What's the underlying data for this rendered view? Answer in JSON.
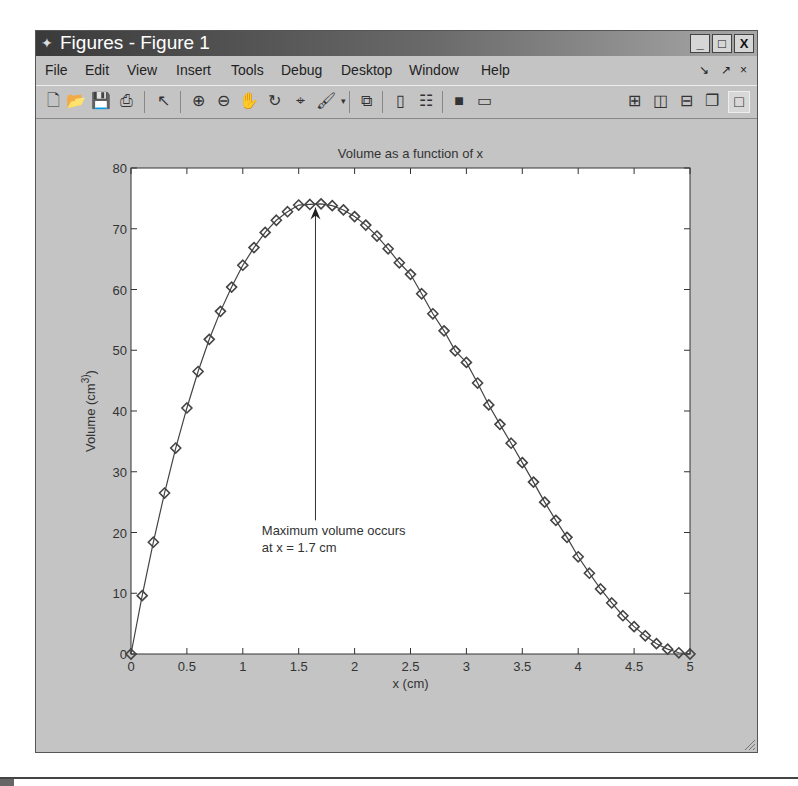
{
  "window": {
    "title": "Figures - Figure 1",
    "controls": {
      "minimize": "_",
      "maximize": "□",
      "close": "X"
    }
  },
  "menubar": {
    "items": [
      "File",
      "Edit",
      "View",
      "Insert",
      "Tools",
      "Debug",
      "Desktop",
      "Window",
      "Help"
    ],
    "dock_controls": {
      "dock": "↘",
      "undock": "↗",
      "close": "×"
    }
  },
  "toolbar": {
    "buttons": [
      "new-figure",
      "open-file",
      "save-figure",
      "print-figure",
      "edit-plot",
      "zoom-in",
      "zoom-out",
      "pan",
      "rotate-3d",
      "data-cursor",
      "brush",
      "link-plot",
      "hide-plot-tools",
      "show-plot-tools",
      "colorbar",
      "legend",
      "tile-2x2",
      "tile-columns",
      "tile-rows",
      "float",
      "maximize"
    ]
  },
  "chart_data": {
    "type": "line",
    "title": "Volume as a function of x",
    "xlabel": "x (cm)",
    "ylabel": "Volume (cm^3)",
    "xlim": [
      0,
      5
    ],
    "ylim": [
      0,
      80
    ],
    "xticks": [
      "0",
      "0.5",
      "1",
      "1.5",
      "2",
      "2.5",
      "3",
      "3.5",
      "4",
      "4.5",
      "5"
    ],
    "yticks": [
      "0",
      "10",
      "20",
      "30",
      "40",
      "50",
      "60",
      "70",
      "80"
    ],
    "grid": false,
    "legend": null,
    "marker": "diamond",
    "series": [
      {
        "name": "V(x)",
        "x": [
          0,
          0.1,
          0.2,
          0.3,
          0.4,
          0.5,
          0.6,
          0.7,
          0.8,
          0.9,
          1.0,
          1.1,
          1.2,
          1.3,
          1.4,
          1.5,
          1.6,
          1.7,
          1.8,
          1.9,
          2.0,
          2.1,
          2.2,
          2.3,
          2.4,
          2.5,
          2.6,
          2.7,
          2.8,
          2.9,
          3.0,
          3.1,
          3.2,
          3.3,
          3.4,
          3.5,
          3.6,
          3.7,
          3.8,
          3.9,
          4.0,
          4.1,
          4.2,
          4.3,
          4.4,
          4.5,
          4.6,
          4.7,
          4.8,
          4.9,
          5.0
        ],
        "values": [
          0,
          9.6,
          18.4,
          26.5,
          33.9,
          40.5,
          46.5,
          51.8,
          56.4,
          60.4,
          64.0,
          66.9,
          69.4,
          71.4,
          72.8,
          73.9,
          74.0,
          74.1,
          73.8,
          73.1,
          72.0,
          70.6,
          68.8,
          66.7,
          64.4,
          62.5,
          59.3,
          56.0,
          53.2,
          49.9,
          48.0,
          44.6,
          41.0,
          37.8,
          34.7,
          31.5,
          28.3,
          25.0,
          22.0,
          19.2,
          16.0,
          13.3,
          10.7,
          8.4,
          6.3,
          4.5,
          3.0,
          1.7,
          0.8,
          0.2,
          0.0
        ]
      }
    ],
    "annotations": [
      {
        "type": "arrow",
        "from": [
          1.65,
          22
        ],
        "to": [
          1.65,
          73.5
        ]
      },
      {
        "type": "text",
        "lines": [
          "Maximum volume occurs",
          "at x = 1.7 cm"
        ],
        "position": [
          1.17,
          18
        ]
      }
    ]
  }
}
